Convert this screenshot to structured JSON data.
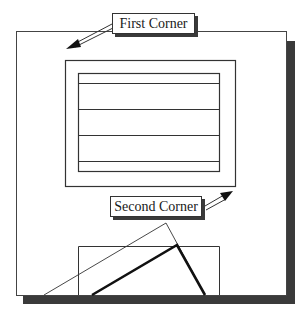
{
  "diagram": {
    "labels": {
      "first_corner": "First Corner",
      "second_corner": "Second Corner"
    },
    "colors": {
      "line": "#333333",
      "shadow": "#3a3a3a",
      "background": "#ffffff"
    }
  }
}
